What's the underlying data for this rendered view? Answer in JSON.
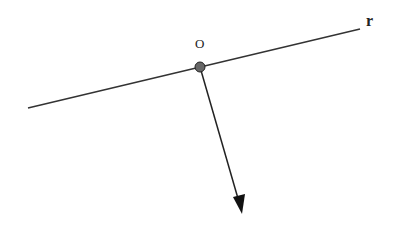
{
  "diagram": {
    "line_label": "r",
    "point_label": "O",
    "line": {
      "x1": 28,
      "y1": 108,
      "x2": 360,
      "y2": 29
    },
    "point": {
      "cx": 200,
      "cy": 67,
      "r": 5
    },
    "arrow": {
      "x1": 200,
      "y1": 67,
      "x2": 242,
      "y2": 214
    },
    "colors": {
      "stroke": "#333333",
      "point_fill": "#666666"
    }
  }
}
